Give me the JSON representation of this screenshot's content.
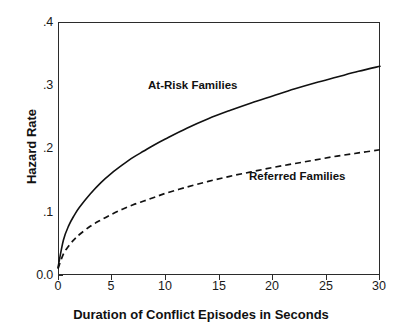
{
  "chart_data": {
    "type": "line",
    "title": "",
    "xlabel": "Duration of Conflict Episodes in Seconds",
    "ylabel": "Hazard Rate",
    "xlim": [
      0,
      30
    ],
    "ylim": [
      0.0,
      0.4
    ],
    "xticks": [
      0,
      5,
      10,
      15,
      20,
      25,
      30
    ],
    "xticklabels": [
      "0",
      "5",
      "10",
      "15",
      "20",
      "25",
      "30"
    ],
    "yticks": [
      0.0,
      0.1,
      0.2,
      0.3,
      0.4
    ],
    "yticklabels": [
      "0.0",
      ".1",
      ".2",
      ".3",
      ".4"
    ],
    "grid": false,
    "legend_position": "inline-annotation",
    "x": [
      0,
      0.5,
      1,
      1.5,
      2,
      3,
      4,
      5,
      6,
      7,
      8,
      9,
      10,
      12,
      14,
      16,
      18,
      20,
      22,
      24,
      26,
      28,
      30
    ],
    "series": [
      {
        "name": "At-Risk Families",
        "style": "solid",
        "color": "#111111",
        "values": [
          0.012,
          0.055,
          0.078,
          0.094,
          0.107,
          0.128,
          0.146,
          0.161,
          0.174,
          0.186,
          0.196,
          0.206,
          0.215,
          0.232,
          0.247,
          0.26,
          0.272,
          0.283,
          0.294,
          0.304,
          0.313,
          0.322,
          0.33
        ]
      },
      {
        "name": "Referred Families",
        "style": "dashed",
        "color": "#111111",
        "values": [
          0.01,
          0.033,
          0.046,
          0.056,
          0.064,
          0.077,
          0.087,
          0.096,
          0.104,
          0.111,
          0.117,
          0.123,
          0.129,
          0.139,
          0.148,
          0.156,
          0.163,
          0.17,
          0.176,
          0.182,
          0.188,
          0.193,
          0.198
        ]
      }
    ],
    "annotations": [
      {
        "text": "At-Risk Families",
        "x": 10,
        "y": 0.305
      },
      {
        "text": "Referred Families",
        "x": 21,
        "y": 0.175
      }
    ]
  }
}
